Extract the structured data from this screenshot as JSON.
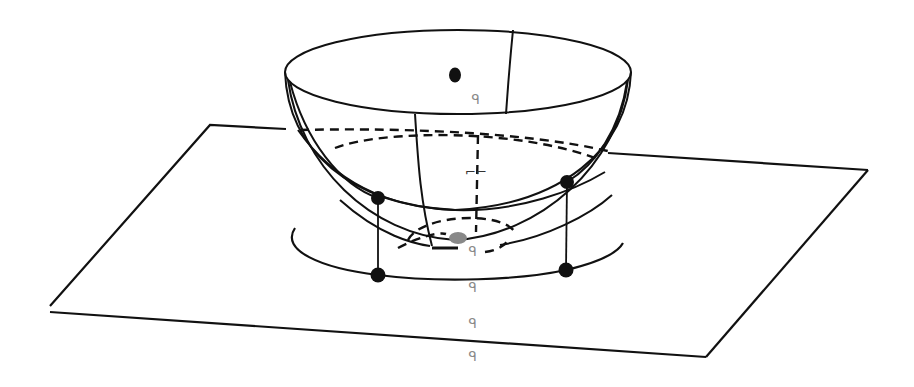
{
  "diagram": {
    "type": "geometry-3d",
    "colors": {
      "stroke": "#111111",
      "label": "#8a8a8a",
      "focus_fill": "#888888",
      "background": "#ffffff"
    },
    "labels": [
      {
        "id": "label-top",
        "text": "ᑫ",
        "x": 472,
        "y": 94
      },
      {
        "id": "label-mid",
        "text": "⌐⌐",
        "x": 466,
        "y": 166
      },
      {
        "id": "label-bottom-1",
        "text": "ᑫ",
        "x": 469,
        "y": 246
      },
      {
        "id": "label-bottom-2",
        "text": "ᑫ",
        "x": 469,
        "y": 282
      },
      {
        "id": "label-bottom-3",
        "text": "ᑫ",
        "x": 469,
        "y": 318
      },
      {
        "id": "label-bottom-4",
        "text": "ᑫ",
        "x": 469,
        "y": 351
      }
    ],
    "points": [
      {
        "id": "point-top-center",
        "x": 455,
        "y": 75
      },
      {
        "id": "point-rim-left",
        "x": 378,
        "y": 198
      },
      {
        "id": "point-rim-right",
        "x": 567,
        "y": 182
      },
      {
        "id": "point-base-left",
        "x": 378,
        "y": 275
      },
      {
        "id": "point-base-right",
        "x": 566,
        "y": 270
      }
    ],
    "plane_corners": [
      [
        210,
        125
      ],
      [
        868,
        170
      ],
      [
        706,
        357
      ],
      [
        50,
        310
      ]
    ]
  }
}
